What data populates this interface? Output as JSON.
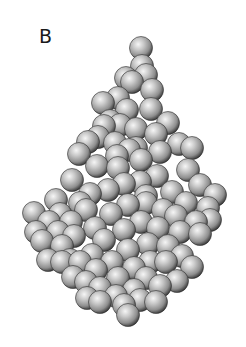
{
  "figure": {
    "panel_label": "B",
    "sphere_color": "#b8b8b8",
    "highlight_color": "#f4f4f4",
    "shadow_color": "#3a3a3a",
    "sphere_radius": 11.5,
    "spheres": [
      [
        56,
        200
      ],
      [
        34,
        213
      ],
      [
        49,
        222
      ],
      [
        42,
        241
      ],
      [
        62,
        246
      ],
      [
        36,
        232
      ],
      [
        60,
        214
      ],
      [
        71,
        222
      ],
      [
        80,
        203
      ],
      [
        72,
        180
      ],
      [
        86,
        210
      ],
      [
        95,
        228
      ],
      [
        74,
        236
      ],
      [
        58,
        232
      ],
      [
        79,
        154
      ],
      [
        98,
        137
      ],
      [
        110,
        121
      ],
      [
        103,
        103
      ],
      [
        127,
        110
      ],
      [
        152,
        90
      ],
      [
        146,
        75
      ],
      [
        115,
        143
      ],
      [
        136,
        129
      ],
      [
        129,
        150
      ],
      [
        151,
        109
      ],
      [
        156,
        134
      ],
      [
        168,
        123
      ],
      [
        97,
        166
      ],
      [
        118,
        168
      ],
      [
        141,
        160
      ],
      [
        160,
        152
      ],
      [
        179,
        144
      ],
      [
        192,
        148
      ],
      [
        188,
        170
      ],
      [
        200,
        185
      ],
      [
        215,
        195
      ],
      [
        208,
        208
      ],
      [
        196,
        222
      ],
      [
        180,
        232
      ],
      [
        168,
        246
      ],
      [
        90,
        194
      ],
      [
        108,
        190
      ],
      [
        124,
        184
      ],
      [
        140,
        182
      ],
      [
        157,
        176
      ],
      [
        172,
        192
      ],
      [
        186,
        203
      ],
      [
        163,
        210
      ],
      [
        146,
        203
      ],
      [
        128,
        205
      ],
      [
        111,
        214
      ],
      [
        92,
        255
      ],
      [
        104,
        240
      ],
      [
        124,
        230
      ],
      [
        141,
        222
      ],
      [
        158,
        228
      ],
      [
        148,
        244
      ],
      [
        128,
        250
      ],
      [
        112,
        262
      ],
      [
        96,
        270
      ],
      [
        80,
        262
      ],
      [
        73,
        277
      ],
      [
        70,
        260
      ],
      [
        86,
        282
      ],
      [
        100,
        288
      ],
      [
        118,
        278
      ],
      [
        134,
        268
      ],
      [
        150,
        262
      ],
      [
        166,
        262
      ],
      [
        182,
        256
      ],
      [
        192,
        267
      ],
      [
        177,
        281
      ],
      [
        160,
        286
      ],
      [
        146,
        278
      ],
      [
        134,
        290
      ],
      [
        116,
        296
      ],
      [
        100,
        302
      ],
      [
        87,
        298
      ],
      [
        124,
        305
      ],
      [
        140,
        300
      ],
      [
        156,
        302
      ],
      [
        128,
        315
      ],
      [
        136,
        148
      ],
      [
        120,
        125
      ],
      [
        132,
        82
      ],
      [
        141,
        48
      ],
      [
        142,
        66
      ],
      [
        126,
        78
      ],
      [
        118,
        98
      ],
      [
        104,
        126
      ],
      [
        88,
        142
      ],
      [
        117,
        156
      ],
      [
        146,
        196
      ],
      [
        176,
        216
      ],
      [
        200,
        234
      ],
      [
        210,
        220
      ],
      [
        62,
        262
      ],
      [
        48,
        260
      ]
    ]
  }
}
